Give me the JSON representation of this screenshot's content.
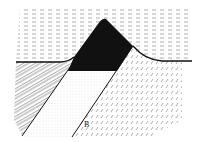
{
  "diagram": {
    "type": "geological-cross-section",
    "labels": [
      {
        "id": "B",
        "text": "B",
        "x": 86,
        "y": 123
      }
    ],
    "units": [
      {
        "name": "water",
        "pattern": "dashed-horizontal"
      },
      {
        "name": "volcanic-cone",
        "pattern": "solid-black"
      },
      {
        "name": "left-bedrock",
        "pattern": "diagonal-hatch-blocks"
      },
      {
        "name": "central-wedge",
        "pattern": "stipple"
      },
      {
        "name": "right-block",
        "pattern": "diagonal-dashes"
      }
    ],
    "colors": {
      "ink": "#111111",
      "background": "#ffffff"
    }
  }
}
